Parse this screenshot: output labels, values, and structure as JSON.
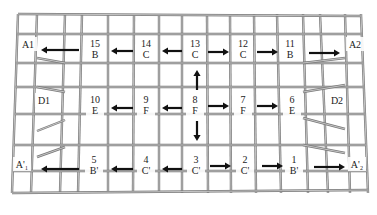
{
  "diagram": {
    "type": "grid-plan",
    "canvas": {
      "width": 377,
      "height": 215
    },
    "colors": {
      "grid": "#7a7a7a",
      "text": "#222222",
      "arrow": "#111111",
      "background": "#ffffff"
    },
    "top_xs": [
      18,
      37,
      65,
      82,
      108,
      134,
      159,
      182,
      207,
      230,
      254,
      277,
      303,
      320,
      345,
      361
    ],
    "bottom_xs": [
      12,
      31,
      60,
      78,
      108,
      133,
      159,
      182,
      208,
      231,
      256,
      281,
      308,
      328,
      350,
      368
    ],
    "rows_y": [
      14,
      34,
      63,
      87,
      114,
      145,
      171,
      193
    ],
    "taper_left": [
      [
        37,
        58,
        65,
        63
      ],
      [
        37,
        87,
        65,
        92
      ],
      [
        37,
        131,
        65,
        120
      ],
      [
        37,
        157,
        65,
        147
      ]
    ],
    "taper_right": [
      [
        303,
        63,
        345,
        58
      ],
      [
        303,
        92,
        345,
        85
      ],
      [
        303,
        118,
        345,
        129
      ],
      [
        303,
        145,
        345,
        153
      ]
    ],
    "cells": [
      {
        "id": "A1",
        "line1": "A1",
        "line2": "",
        "x": 28,
        "y": 48
      },
      {
        "id": "15",
        "line1": "15",
        "line2": "B",
        "x": 95,
        "y": 48
      },
      {
        "id": "14",
        "line1": "14",
        "line2": "C",
        "x": 146,
        "y": 48
      },
      {
        "id": "13",
        "line1": "13",
        "line2": "C",
        "x": 195,
        "y": 48
      },
      {
        "id": "12",
        "line1": "12",
        "line2": "C",
        "x": 243,
        "y": 48
      },
      {
        "id": "11",
        "line1": "11",
        "line2": "B",
        "x": 290,
        "y": 48
      },
      {
        "id": "A2",
        "line1": "A2",
        "line2": "",
        "x": 355,
        "y": 48
      },
      {
        "id": "D1",
        "line1": "D1",
        "line2": "",
        "x": 44,
        "y": 104
      },
      {
        "id": "10",
        "line1": "10",
        "line2": "E",
        "x": 95,
        "y": 104
      },
      {
        "id": "9",
        "line1": "9",
        "line2": "F",
        "x": 146,
        "y": 104
      },
      {
        "id": "8",
        "line1": "8",
        "line2": "F",
        "x": 195,
        "y": 104
      },
      {
        "id": "7",
        "line1": "7",
        "line2": "F",
        "x": 243,
        "y": 104
      },
      {
        "id": "6",
        "line1": "6",
        "line2": "E",
        "x": 292,
        "y": 104
      },
      {
        "id": "D2",
        "line1": "D2",
        "line2": "",
        "x": 337,
        "y": 104
      },
      {
        "id": "A'1",
        "line1": "A'₁",
        "line2": "",
        "x": 22,
        "y": 168
      },
      {
        "id": "5",
        "line1": "5",
        "line2": "B'",
        "x": 94,
        "y": 164
      },
      {
        "id": "4",
        "line1": "4",
        "line2": "C'",
        "x": 146,
        "y": 164
      },
      {
        "id": "3",
        "line1": "3",
        "line2": "C'",
        "x": 196,
        "y": 164
      },
      {
        "id": "2",
        "line1": "2",
        "line2": "C'",
        "x": 245,
        "y": 164
      },
      {
        "id": "1",
        "line1": "1",
        "line2": "B'",
        "x": 294,
        "y": 164
      },
      {
        "id": "A'2",
        "line1": "A'₂",
        "line2": "",
        "x": 357,
        "y": 168
      }
    ],
    "arrows": [
      {
        "from": [
          79,
          50
        ],
        "to": [
          41,
          50
        ]
      },
      {
        "from": [
          133,
          51
        ],
        "to": [
          111,
          51
        ]
      },
      {
        "from": [
          182,
          51
        ],
        "to": [
          162,
          51
        ]
      },
      {
        "from": [
          208,
          52
        ],
        "to": [
          229,
          52
        ]
      },
      {
        "from": [
          257,
          52
        ],
        "to": [
          278,
          52
        ]
      },
      {
        "from": [
          309,
          53
        ],
        "to": [
          340,
          53
        ]
      },
      {
        "from": [
          197,
          90
        ],
        "to": [
          197,
          70
        ]
      },
      {
        "from": [
          133,
          108
        ],
        "to": [
          111,
          108
        ]
      },
      {
        "from": [
          182,
          108
        ],
        "to": [
          162,
          108
        ]
      },
      {
        "from": [
          208,
          106
        ],
        "to": [
          229,
          106
        ]
      },
      {
        "from": [
          257,
          106
        ],
        "to": [
          278,
          106
        ]
      },
      {
        "from": [
          197,
          121
        ],
        "to": [
          197,
          141
        ]
      },
      {
        "from": [
          79,
          169
        ],
        "to": [
          41,
          169
        ]
      },
      {
        "from": [
          133,
          169
        ],
        "to": [
          111,
          169
        ]
      },
      {
        "from": [
          182,
          169
        ],
        "to": [
          162,
          169
        ]
      },
      {
        "from": [
          210,
          166
        ],
        "to": [
          231,
          166
        ]
      },
      {
        "from": [
          262,
          166
        ],
        "to": [
          283,
          166
        ]
      },
      {
        "from": [
          314,
          167
        ],
        "to": [
          345,
          167
        ]
      }
    ]
  }
}
